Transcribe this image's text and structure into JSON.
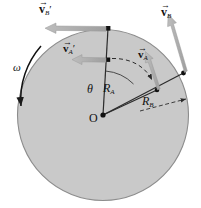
{
  "figure": {
    "type": "physics-diagram",
    "disk": {
      "center_label": "O",
      "fill_color": "#c9c9c9",
      "edge_color": "#8a8a8a",
      "center_x": 103,
      "center_y": 115,
      "radius": 86
    },
    "labels": {
      "omega": "ω",
      "theta": "θ",
      "center": "O",
      "radius_a_base": "R",
      "radius_a_sub": "A",
      "radius_b_base": "R",
      "radius_b_sub": "B",
      "v_a_base": "v",
      "v_a_sub": "A",
      "v_a_prime_base": "v",
      "v_a_prime_sub": "A",
      "v_a_prime_mark": "′",
      "v_b_base": "v",
      "v_b_sub": "B",
      "v_b_prime_base": "v",
      "v_b_prime_sub": "B",
      "v_b_prime_mark": "′"
    },
    "vectors": [
      {
        "name": "v-b-prime",
        "label": "vB'",
        "color": "#a9a9a9",
        "direction": "left",
        "origin": "top of disk"
      },
      {
        "name": "v-a-prime",
        "label": "vA'",
        "color": "#a9a9a9",
        "direction": "left",
        "origin": "point A prime"
      },
      {
        "name": "v-b",
        "label": "vB",
        "color": "#a9a9a9",
        "direction": "up-left",
        "origin": "point B on rim"
      },
      {
        "name": "v-a",
        "label": "vA",
        "color": "#a9a9a9",
        "direction": "up-left",
        "origin": "point A"
      }
    ],
    "rotation": {
      "sense": "counterclockwise",
      "symbol": "ω"
    }
  }
}
